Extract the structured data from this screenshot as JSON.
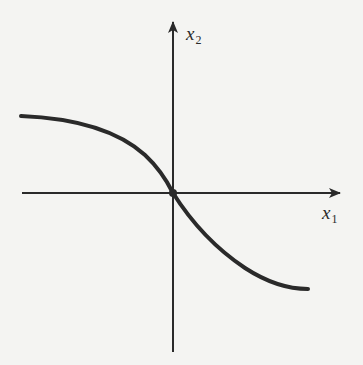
{
  "figure": {
    "type": "function-curve-diagram",
    "background_color": "#f4f4f2",
    "ink_color": "#2a2a2a",
    "axes": {
      "horizontal": {
        "label_base": "x",
        "label_sub": "1",
        "start": [
          22,
          193
        ],
        "end": [
          340,
          193
        ]
      },
      "vertical": {
        "label_base": "x",
        "label_sub": "2",
        "start": [
          173,
          352
        ],
        "end": [
          173,
          22
        ]
      },
      "origin": [
        173,
        193
      ]
    },
    "curve": {
      "description": "Decreasing S-shaped curve through origin, flattening at both ends",
      "path": "M21,116 C70,118 115,128 145,155 C160,169 168,183 173,193 C190,220 215,248 245,268 C265,281 285,289 308,289",
      "stroke_width": 4
    },
    "origin_marker": {
      "radius": 4
    }
  }
}
